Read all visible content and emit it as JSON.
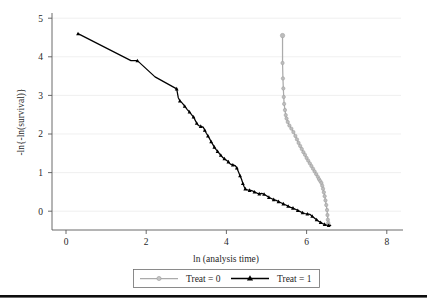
{
  "chart_data": {
    "type": "line",
    "title": "",
    "subtitle": "",
    "xlabel": "ln (analysis time)",
    "ylabel": "-ln{-ln(survival)}",
    "xlim": [
      -0.35,
      8.35
    ],
    "ylim": [
      -0.75,
      5.3
    ],
    "xticks": [
      0,
      2,
      4,
      6,
      8
    ],
    "xticklabels": [
      "0",
      "2",
      "4",
      "6",
      "8"
    ],
    "yticks": [
      0,
      1,
      2,
      3,
      4,
      5
    ],
    "yticklabels": [
      "0",
      "1",
      "2",
      "3",
      "4",
      "5"
    ],
    "grid": "horizontal",
    "legend_position": "below-axes",
    "series": [
      {
        "name": "Treat = 0",
        "color": "#ababab",
        "marker": "circle-open",
        "points": [
          [
            5.4,
            4.55
          ],
          [
            5.4,
            3.84
          ],
          [
            5.41,
            3.44
          ],
          [
            5.42,
            3.18
          ],
          [
            5.43,
            2.96
          ],
          [
            5.44,
            2.78
          ],
          [
            5.46,
            2.62
          ],
          [
            5.48,
            2.49
          ],
          [
            5.5,
            2.4
          ],
          [
            5.53,
            2.31
          ],
          [
            5.57,
            2.22
          ],
          [
            5.62,
            2.14
          ],
          [
            5.67,
            2.05
          ],
          [
            5.72,
            1.95
          ],
          [
            5.76,
            1.86
          ],
          [
            5.8,
            1.77
          ],
          [
            5.84,
            1.69
          ],
          [
            5.88,
            1.61
          ],
          [
            5.92,
            1.53
          ],
          [
            5.96,
            1.46
          ],
          [
            6.0,
            1.38
          ],
          [
            6.04,
            1.31
          ],
          [
            6.08,
            1.24
          ],
          [
            6.12,
            1.17
          ],
          [
            6.16,
            1.1
          ],
          [
            6.2,
            1.03
          ],
          [
            6.24,
            0.96
          ],
          [
            6.28,
            0.89
          ],
          [
            6.31,
            0.83
          ],
          [
            6.34,
            0.78
          ],
          [
            6.37,
            0.73
          ],
          [
            6.39,
            0.66
          ],
          [
            6.41,
            0.58
          ],
          [
            6.43,
            0.49
          ],
          [
            6.45,
            0.39
          ],
          [
            6.47,
            0.28
          ],
          [
            6.49,
            0.16
          ],
          [
            6.51,
            0.03
          ],
          [
            6.52,
            -0.1
          ],
          [
            6.53,
            -0.22
          ],
          [
            6.54,
            -0.3
          ],
          [
            6.55,
            -0.35
          ]
        ]
      },
      {
        "name": "Treat = 1",
        "color": "#000000",
        "marker": "triangle-filled",
        "points": [
          [
            0.3,
            4.6
          ],
          [
            1.62,
            3.9
          ],
          [
            1.78,
            3.9
          ],
          [
            2.22,
            3.48
          ],
          [
            2.76,
            3.17
          ],
          [
            2.8,
            2.94
          ],
          [
            2.84,
            2.86
          ],
          [
            2.9,
            2.8
          ],
          [
            2.96,
            2.72
          ],
          [
            3.02,
            2.64
          ],
          [
            3.08,
            2.57
          ],
          [
            3.13,
            2.5
          ],
          [
            3.18,
            2.44
          ],
          [
            3.22,
            2.36
          ],
          [
            3.26,
            2.28
          ],
          [
            3.3,
            2.22
          ],
          [
            3.36,
            2.2
          ],
          [
            3.42,
            2.18
          ],
          [
            3.46,
            2.1
          ],
          [
            3.5,
            2.02
          ],
          [
            3.54,
            1.95
          ],
          [
            3.58,
            1.88
          ],
          [
            3.62,
            1.8
          ],
          [
            3.66,
            1.73
          ],
          [
            3.7,
            1.66
          ],
          [
            3.74,
            1.6
          ],
          [
            3.78,
            1.55
          ],
          [
            3.82,
            1.5
          ],
          [
            3.86,
            1.45
          ],
          [
            3.9,
            1.4
          ],
          [
            3.95,
            1.36
          ],
          [
            4.0,
            1.32
          ],
          [
            4.05,
            1.28
          ],
          [
            4.1,
            1.22
          ],
          [
            4.16,
            1.2
          ],
          [
            4.22,
            1.18
          ],
          [
            4.26,
            1.12
          ],
          [
            4.3,
            1.02
          ],
          [
            4.34,
            0.92
          ],
          [
            4.38,
            0.82
          ],
          [
            4.41,
            0.72
          ],
          [
            4.44,
            0.64
          ],
          [
            4.47,
            0.58
          ],
          [
            4.52,
            0.55
          ],
          [
            4.58,
            0.54
          ],
          [
            4.64,
            0.53
          ],
          [
            4.7,
            0.5
          ],
          [
            4.76,
            0.47
          ],
          [
            4.82,
            0.45
          ],
          [
            4.88,
            0.46
          ],
          [
            4.94,
            0.44
          ],
          [
            5.0,
            0.4
          ],
          [
            5.06,
            0.36
          ],
          [
            5.12,
            0.33
          ],
          [
            5.18,
            0.3
          ],
          [
            5.24,
            0.28
          ],
          [
            5.3,
            0.25
          ],
          [
            5.36,
            0.22
          ],
          [
            5.42,
            0.19
          ],
          [
            5.48,
            0.16
          ],
          [
            5.54,
            0.13
          ],
          [
            5.6,
            0.1
          ],
          [
            5.66,
            0.08
          ],
          [
            5.72,
            0.05
          ],
          [
            5.78,
            0.02
          ],
          [
            5.84,
            -0.01
          ],
          [
            5.9,
            -0.04
          ],
          [
            5.96,
            -0.06
          ],
          [
            6.02,
            -0.07
          ],
          [
            6.08,
            -0.08
          ],
          [
            6.14,
            -0.13
          ],
          [
            6.2,
            -0.18
          ],
          [
            6.25,
            -0.22
          ],
          [
            6.3,
            -0.26
          ],
          [
            6.35,
            -0.29
          ],
          [
            6.4,
            -0.32
          ],
          [
            6.45,
            -0.34
          ],
          [
            6.5,
            -0.36
          ],
          [
            6.55,
            -0.37
          ],
          [
            6.6,
            -0.37
          ]
        ]
      }
    ]
  },
  "legend": {
    "items": [
      {
        "label": "Treat = 0",
        "color": "#ababab",
        "marker": "circle-open"
      },
      {
        "label": "Treat = 1",
        "color": "#000000",
        "marker": "triangle-filled"
      }
    ]
  }
}
